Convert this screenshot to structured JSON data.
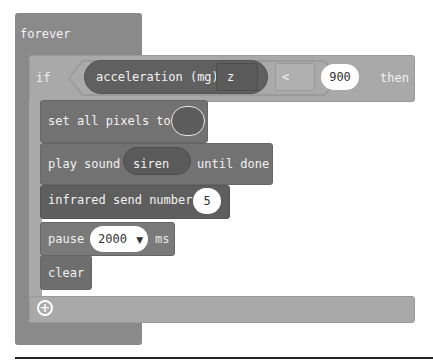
{
  "workspace": {
    "forever_block": {
      "label": "forever",
      "color": "#8a8a8a"
    },
    "if_block": {
      "if_label": "if",
      "then_label": "then",
      "color": "#a9a9a9",
      "condition": {
        "reporter_label": "acceleration (mg)",
        "axis_dropdown": "z",
        "operator": "<",
        "value": "900"
      },
      "add_else_icon": "plus-circle-icon"
    },
    "statements": [
      {
        "label": "set all pixels to",
        "color_value": "dark-gray"
      },
      {
        "label": "play sound",
        "sound": "siren",
        "suffix": "until done"
      },
      {
        "label": "infrared send number",
        "value": "5"
      },
      {
        "label": "pause",
        "value": "2000",
        "dropdown_icon": "caret-down-icon",
        "suffix": "ms"
      },
      {
        "label": "clear"
      }
    ]
  }
}
